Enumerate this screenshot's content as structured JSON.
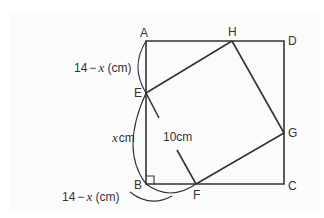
{
  "diagram": {
    "type": "geometry",
    "colors": {
      "stroke": "#333333",
      "background": "#fbfbfb"
    },
    "vertices": {
      "A": {
        "label": "A",
        "x": 146,
        "y": 41
      },
      "B": {
        "label": "B",
        "x": 146,
        "y": 184
      },
      "C": {
        "label": "C",
        "x": 284,
        "y": 184
      },
      "D": {
        "label": "D",
        "x": 284,
        "y": 41
      },
      "E": {
        "label": "E",
        "x": 146,
        "y": 93
      },
      "F": {
        "label": "F",
        "x": 196,
        "y": 184
      },
      "G": {
        "label": "G",
        "x": 284,
        "y": 133
      },
      "H": {
        "label": "H",
        "x": 232,
        "y": 41
      }
    },
    "labels": {
      "ae": {
        "num": "14",
        "minus": "−",
        "var": "x",
        "unit": " (cm)"
      },
      "eb": {
        "var": "x",
        "unit": "cm"
      },
      "bf": {
        "num": "14",
        "minus": "−",
        "var": "x",
        "unit": " (cm)"
      },
      "ef": {
        "text": "10cm"
      }
    }
  }
}
